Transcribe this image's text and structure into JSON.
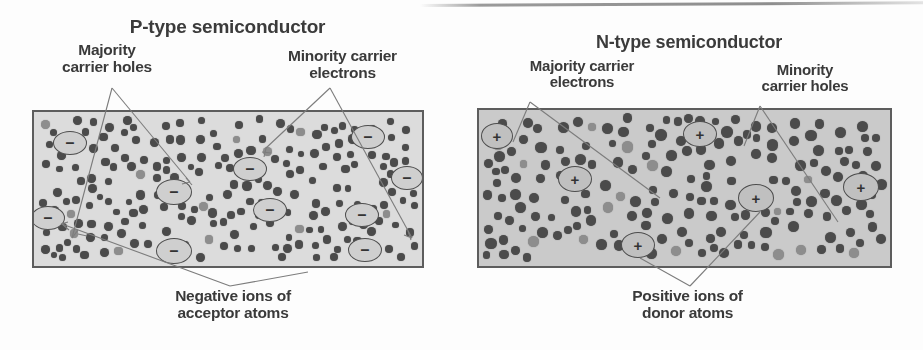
{
  "figure": {
    "kind": "semiconductor-doping-diagram",
    "panels": [
      {
        "id": "p-type",
        "title": "P-type semiconductor",
        "box": {
          "x": 32,
          "y": 110,
          "w": 392,
          "h": 158,
          "fill": "#dcdcdc",
          "stroke": "#5d5d5d"
        },
        "labels": {
          "top_left": "Majority\ncarrier holes",
          "top_right": "Minority carrier\nelectrons",
          "bottom": "Negative ions of\nacceptor atoms"
        },
        "ion_symbol": "–",
        "ion_meaning": "negative acceptor ion",
        "ion_count": 8,
        "ions": [
          {
            "cx": 68,
            "cy": 141,
            "rx": 17,
            "ry": 12
          },
          {
            "cx": 248,
            "cy": 167,
            "rx": 17,
            "ry": 12
          },
          {
            "cx": 172,
            "cy": 190,
            "rx": 18,
            "ry": 13
          },
          {
            "cx": 366,
            "cy": 135,
            "rx": 17,
            "ry": 12
          },
          {
            "cx": 405,
            "cy": 176,
            "rx": 16,
            "ry": 12
          },
          {
            "cx": 46,
            "cy": 216,
            "rx": 17,
            "ry": 12
          },
          {
            "cx": 268,
            "cy": 208,
            "rx": 17,
            "ry": 12
          },
          {
            "cx": 360,
            "cy": 213,
            "rx": 17,
            "ry": 12
          },
          {
            "cx": 172,
            "cy": 249,
            "rx": 18,
            "ry": 13
          },
          {
            "cx": 363,
            "cy": 248,
            "rx": 17,
            "ry": 12
          }
        ]
      },
      {
        "id": "n-type",
        "title": "N-type semiconductor",
        "box": {
          "x": 477,
          "y": 108,
          "w": 415,
          "h": 160,
          "fill": "#cacaca",
          "stroke": "#5d5d5d"
        },
        "labels": {
          "top_left": "Majority carrier\nelectrons",
          "top_right": "Minority\ncarrier holes",
          "bottom": "Positive ions of\ndonor atoms"
        },
        "ion_symbol": "+",
        "ion_meaning": "positive donor ion",
        "ion_count": 5,
        "ions": [
          {
            "cx": 495,
            "cy": 134,
            "rx": 16,
            "ry": 13
          },
          {
            "cx": 573,
            "cy": 177,
            "rx": 17,
            "ry": 13
          },
          {
            "cx": 698,
            "cy": 132,
            "rx": 17,
            "ry": 13
          },
          {
            "cx": 754,
            "cy": 196,
            "rx": 18,
            "ry": 14
          },
          {
            "cx": 859,
            "cy": 185,
            "rx": 18,
            "ry": 14
          },
          {
            "cx": 636,
            "cy": 243,
            "rx": 17,
            "ry": 13
          }
        ]
      }
    ],
    "colors": {
      "dot": "#4b4b4b",
      "ion_fill": "#cfcfcf",
      "outline": "#5d5d5d",
      "text": "#3a3a3a",
      "leader": "#7c7c7c",
      "page_background": "#fdfdfd"
    },
    "icons": {
      "minus_ion": "minus-ion-icon",
      "plus_ion": "plus-ion-icon",
      "carrier_dot": "carrier-dot-icon",
      "leader_arrow": "leader-arrow-icon"
    }
  }
}
